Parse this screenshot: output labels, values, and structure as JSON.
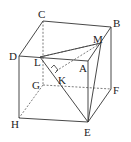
{
  "diagram": {
    "type": "cube-geometry",
    "vertices": {
      "A": {
        "label": "A",
        "x": 88,
        "y": 61,
        "lx": 79,
        "ly": 71
      },
      "B": {
        "label": "B",
        "x": 111,
        "y": 27,
        "lx": 113,
        "ly": 27
      },
      "C": {
        "label": "C",
        "x": 43,
        "y": 21,
        "lx": 37,
        "ly": 17
      },
      "D": {
        "label": "D",
        "x": 19,
        "y": 56,
        "lx": 9,
        "ly": 59
      },
      "E": {
        "label": "E",
        "x": 88,
        "y": 122,
        "lx": 84,
        "ly": 135
      },
      "F": {
        "label": "F",
        "x": 111,
        "y": 89,
        "lx": 113,
        "ly": 93
      },
      "G": {
        "label": "G",
        "x": 43,
        "y": 85,
        "lx": 32,
        "ly": 88
      },
      "H": {
        "label": "H",
        "x": 19,
        "y": 118,
        "lx": 10,
        "ly": 127
      },
      "L": {
        "label": "L",
        "x": 40,
        "y": 57,
        "lx": 33,
        "ly": 66
      },
      "M": {
        "label": "M",
        "x": 101,
        "y": 43,
        "lx": 93,
        "ly": 42
      },
      "K": {
        "label": "K",
        "x": 57,
        "y": 76,
        "lx": 58,
        "ly": 84
      }
    },
    "solid_edges": [
      [
        "C",
        "B"
      ],
      [
        "C",
        "D"
      ],
      [
        "D",
        "A"
      ],
      [
        "A",
        "B"
      ],
      [
        "D",
        "H"
      ],
      [
        "H",
        "E"
      ],
      [
        "E",
        "F"
      ],
      [
        "F",
        "B"
      ],
      [
        "A",
        "E"
      ],
      [
        "L",
        "M"
      ],
      [
        "M",
        "E"
      ],
      [
        "L",
        "E"
      ],
      [
        "B",
        "E"
      ]
    ],
    "dashed_edges": [
      [
        "C",
        "G"
      ],
      [
        "G",
        "F"
      ],
      [
        "G",
        "H"
      ],
      [
        "L",
        "A2"
      ],
      [
        "K",
        "M"
      ]
    ],
    "right_angle_at": "K"
  }
}
